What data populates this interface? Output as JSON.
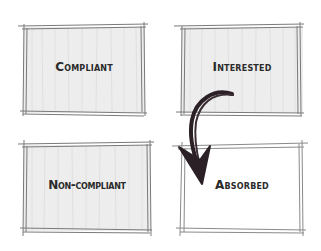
{
  "diagram": {
    "type": "2x2 quadrant sketch",
    "quadrants": [
      {
        "id": "top-left",
        "label": "Compliant",
        "shaded": true
      },
      {
        "id": "top-right",
        "label": "Interested",
        "shaded": true
      },
      {
        "id": "bottom-left",
        "label": "Non-compliant",
        "shaded": true
      },
      {
        "id": "bottom-right",
        "label": "Absorbed",
        "shaded": false
      }
    ],
    "arrow": {
      "from": "Interested",
      "to": "Absorbed",
      "style": "curved hand-drawn"
    },
    "colors": {
      "ink": "#2a2a2a",
      "pencil": "#8a8a8a",
      "shade": "#ececec"
    }
  }
}
